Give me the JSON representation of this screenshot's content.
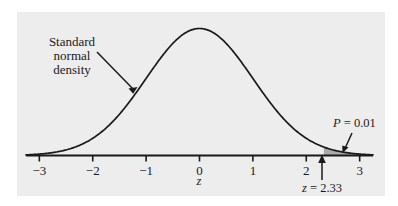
{
  "figure": {
    "panel_background": "#ededed",
    "ink_color": "#1a1a1a",
    "tail_fill": "#a9a9a9"
  },
  "chart_data": {
    "type": "line",
    "title": "",
    "xlabel": "z",
    "ylabel": "",
    "xlim": [
      -3.25,
      3.25
    ],
    "ylim": [
      0,
      0.42
    ],
    "grid": false,
    "legend": null,
    "curve": {
      "name": "Standard normal density",
      "function": "standard normal pdf",
      "mean": 0,
      "sd": 1,
      "peak_value": 0.3989,
      "peak_x": 0
    },
    "x_ticks": [
      -3,
      -2,
      -1,
      0,
      1,
      2,
      3
    ],
    "x_tick_labels": [
      "−3",
      "−2",
      "−1",
      "0",
      "1",
      "2",
      "3"
    ],
    "shaded_region": {
      "from": 2.33,
      "to": 3.25,
      "area": 0.01,
      "label": "P = 0.01"
    },
    "annotations": [
      {
        "name": "curve-label",
        "lines": [
          "Standard",
          "normal",
          "density"
        ],
        "text_x": 72,
        "text_y": 52,
        "points_to": [
          137,
          88
        ]
      },
      {
        "name": "tail-probability-label",
        "text": "P = 0.01",
        "math_prefix": "P",
        "math_rest": " = 0.01",
        "points_to": [
          343,
          152
        ]
      },
      {
        "name": "critical-value-label",
        "text": "z = 2.33",
        "math_prefix": "z",
        "math_rest": " = 2.33",
        "value": 2.33,
        "points_to": [
          322,
          156
        ]
      }
    ]
  },
  "labels": {
    "curve_line_1": "Standard",
    "curve_line_2": "normal",
    "curve_line_3": "density",
    "tail_prob_var": "P",
    "tail_prob_rest": " = 0.01",
    "critical_var": "z",
    "critical_rest": " = 2.33",
    "axis_title": "z",
    "tick_neg3": "−3",
    "tick_neg2": "−2",
    "tick_neg1": "−1",
    "tick_0": "0",
    "tick_1": "1",
    "tick_2": "2",
    "tick_3": "3"
  }
}
